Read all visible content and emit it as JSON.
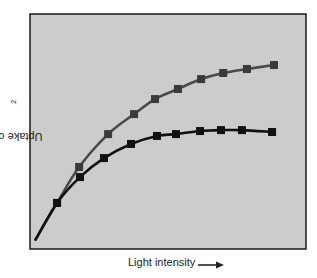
{
  "chart_data": {
    "type": "line",
    "title": "",
    "xlabel": "Light intensity",
    "xlabel_arrow": "right-arrow",
    "ylabel": "Uptake of CO",
    "ylabel_subscript": "2",
    "xlim": [
      0,
      10
    ],
    "ylim": [
      0,
      10
    ],
    "grid": false,
    "ticks": false,
    "legend": null,
    "background": "#cccccc",
    "frame_color": "#1a1a1a",
    "curve_start": {
      "x": 0.2,
      "y": 0.4
    },
    "series": [
      {
        "name": "upper curve",
        "color": "#4a4a4a",
        "marker": "square",
        "marker_color": "#3a3a3a",
        "x": [
          0.98,
          1.78,
          2.83,
          3.77,
          4.53,
          5.36,
          6.2,
          7.0,
          7.86,
          8.84
        ],
        "y": [
          1.96,
          3.49,
          4.89,
          5.74,
          6.38,
          6.81,
          7.23,
          7.49,
          7.66,
          7.83
        ]
      },
      {
        "name": "lower curve",
        "color": "#111111",
        "marker": "square",
        "marker_color": "#111111",
        "x": [
          0.98,
          1.81,
          2.68,
          3.66,
          4.6,
          5.29,
          6.16,
          6.92,
          7.68,
          8.77
        ],
        "y": [
          1.96,
          3.06,
          3.87,
          4.47,
          4.81,
          4.89,
          5.02,
          5.06,
          5.06,
          4.98
        ]
      }
    ]
  },
  "labels": {
    "x": "Light intensity",
    "y_main": "Uptake of CO",
    "y_sub": "2"
  }
}
